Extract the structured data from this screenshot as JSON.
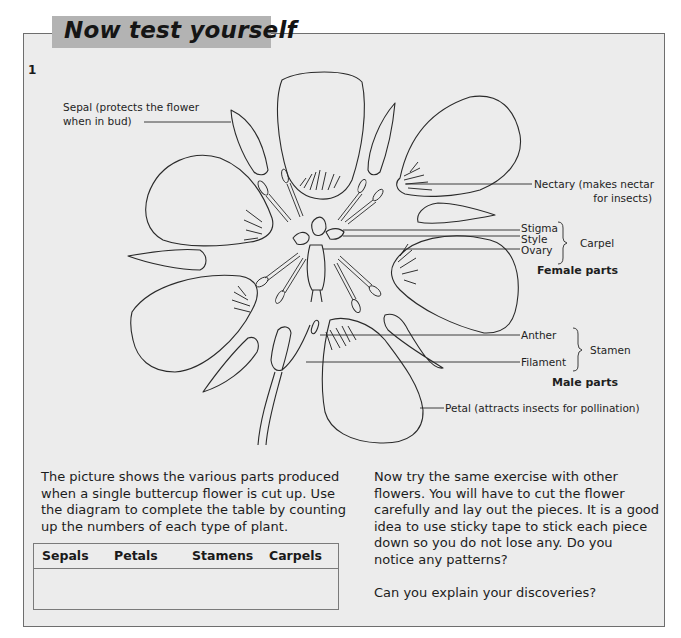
{
  "header": {
    "title": "Now test yourself"
  },
  "question": {
    "number": "1"
  },
  "diagram": {
    "labels": {
      "sepal": [
        "Sepal (protects the flower",
        "when in bud)"
      ],
      "nectary": [
        "Nectary (makes nectar",
        "for insects)"
      ],
      "stigma": "Stigma",
      "style": "Style",
      "ovary": "Ovary",
      "carpel": "Carpel",
      "female_parts": "Female parts",
      "anther": "Anther",
      "filament": "Filament",
      "stamen": "Stamen",
      "male_parts": "Male parts",
      "petal": "Petal (attracts insects for pollination)"
    }
  },
  "left_text": {
    "lines": [
      "The picture shows the various parts produced",
      "when a single buttercup flower is cut up. Use",
      "the diagram to complete the table by counting",
      "up the numbers of each type of plant."
    ]
  },
  "table": {
    "columns": [
      "Sepals",
      "Petals",
      "Stamens",
      "Carpels"
    ],
    "rows": [
      [
        "",
        "",
        "",
        ""
      ]
    ]
  },
  "right_text": {
    "lines": [
      "Now try the same exercise with other",
      "flowers. You will have to cut the flower",
      "carefully and lay out the pieces. It is a good",
      "idea to use sticky tape to stick each piece",
      "down so you do not lose any. Do you",
      "notice any patterns?"
    ],
    "question": "Can you explain your discoveries?"
  },
  "colors": {
    "page": "#ffffff",
    "box_bg": "#ececec",
    "box_border": "#6e6e6e",
    "title_tab": "#b3b3b3",
    "ink": "#1a1a1a"
  }
}
